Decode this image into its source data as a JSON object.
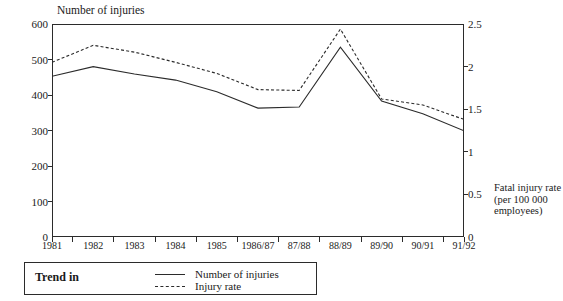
{
  "clipped_top_text": "",
  "axes": {
    "left_title": "Number of injuries",
    "right_title": "Fatal injury rate (per 100 000 employees)",
    "left_ticks": [
      "0",
      "100",
      "200",
      "300",
      "400",
      "500",
      "600"
    ],
    "right_ticks": [
      "0",
      "0.5",
      "1",
      "1.5",
      "2",
      "2.5"
    ],
    "x_ticks": [
      "1981",
      "1982",
      "1983",
      "1984",
      "1985",
      "1986/87",
      "87/88",
      "88/89",
      "89/90",
      "90/91",
      "91/92"
    ]
  },
  "legend": {
    "title": "Trend in",
    "entries": [
      {
        "label": "Number of injuries",
        "style": "solid"
      },
      {
        "label": "Injury rate",
        "style": "dashed"
      }
    ]
  },
  "colors": {
    "line": "#2b2b2b",
    "frame": "#2b2b2b",
    "background": "#ffffff"
  },
  "chart_data": {
    "type": "line",
    "title": "Number of injuries",
    "xlabel": "",
    "ylabel": "Number of injuries",
    "y2label": "Fatal injury rate (per 100 000 employees)",
    "grid": false,
    "legend_position": "bottom-left",
    "categories": [
      "1981",
      "1982",
      "1983",
      "1984",
      "1985",
      "1986/87",
      "87/88",
      "88/89",
      "89/90",
      "90/91",
      "91/92"
    ],
    "ylim": [
      0,
      600
    ],
    "y2lim": [
      0,
      2.5
    ],
    "yticks": [
      0,
      100,
      200,
      300,
      400,
      500,
      600
    ],
    "y2ticks": [
      0,
      0.5,
      1,
      1.5,
      2,
      2.5
    ],
    "series": [
      {
        "name": "Number of injuries",
        "style": "solid",
        "axis": "left",
        "values": [
          453,
          480,
          459,
          442,
          409,
          363,
          366,
          535,
          383,
          347,
          299
        ]
      },
      {
        "name": "Injury rate",
        "style": "dashed",
        "axis": "right",
        "values": [
          2.05,
          2.25,
          2.17,
          2.05,
          1.92,
          1.73,
          1.72,
          2.44,
          1.62,
          1.55,
          1.38
        ]
      }
    ]
  }
}
